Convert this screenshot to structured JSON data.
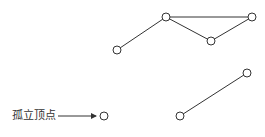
{
  "diagram": {
    "type": "graph",
    "annotation": {
      "label": "孤立顶点",
      "points_to": "isolated"
    },
    "colors": {
      "edge": "#333333",
      "vertex_stroke": "#333333",
      "vertex_fill": "#ffffff",
      "text": "#333333"
    },
    "vertices": [
      {
        "id": "A",
        "x": 117,
        "y": 50
      },
      {
        "id": "B",
        "x": 166,
        "y": 17
      },
      {
        "id": "C",
        "x": 211,
        "y": 41
      },
      {
        "id": "D",
        "x": 252,
        "y": 17
      },
      {
        "id": "E",
        "x": 247,
        "y": 73
      },
      {
        "id": "F",
        "x": 180,
        "y": 116
      },
      {
        "id": "isolated",
        "x": 104,
        "y": 116
      }
    ],
    "edges": [
      [
        "A",
        "B"
      ],
      [
        "B",
        "D"
      ],
      [
        "B",
        "C"
      ],
      [
        "C",
        "D"
      ],
      [
        "F",
        "E"
      ]
    ]
  }
}
